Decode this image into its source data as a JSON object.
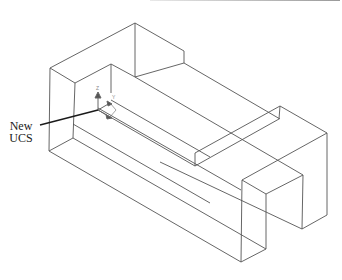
{
  "figure": {
    "callout": {
      "line1": "New",
      "line2": "UCS"
    },
    "ucs_icon": {
      "axis_z_label": "Z",
      "axis_y_label": "Y"
    },
    "colors": {
      "edge": "#555555",
      "leader": "#1a1a1a",
      "background": "#ffffff"
    }
  }
}
